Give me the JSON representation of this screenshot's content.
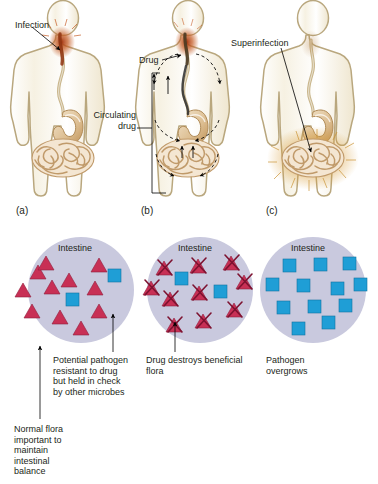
{
  "figure": {
    "type": "biological-diagram",
    "background_color": "#ffffff"
  },
  "top_row": {
    "panels": [
      {
        "letter": "(a)",
        "name": "panel-a-infection",
        "callouts": [
          {
            "name": "infection-label",
            "text": "Infection"
          }
        ]
      },
      {
        "letter": "(b)",
        "name": "panel-b-drug",
        "callouts": [
          {
            "name": "drug-label",
            "text": "Drug"
          },
          {
            "name": "circulating-drug-label",
            "text": "Circulating\ndrug"
          }
        ]
      },
      {
        "letter": "(c)",
        "name": "panel-c-superinfection",
        "callouts": [
          {
            "name": "superinfection-label",
            "text": "Superinfection"
          }
        ]
      }
    ]
  },
  "bottom_row": {
    "circle_title": "Intestine",
    "panels": [
      {
        "name": "intestine-circle-normal-flora",
        "title": "Intestine",
        "captions": [
          {
            "name": "caption-potential-pathogen",
            "text": "Potential pathogen\nresistant to drug\nbut held in check\nby other microbes"
          },
          {
            "name": "caption-normal-flora",
            "text": "Normal flora\nimportant to\nmaintain\nintestinal\nbalance"
          }
        ],
        "organisms": {
          "normal_flora_triangles": 11,
          "pathogen_squares": 2,
          "destroyed_flora": 0
        }
      },
      {
        "name": "intestine-circle-drug-destroys-flora",
        "title": "Intestine",
        "captions": [
          {
            "name": "caption-drug-destroys",
            "text": "Drug destroys beneficial\nflora"
          }
        ],
        "organisms": {
          "normal_flora_triangles": 0,
          "pathogen_squares": 4,
          "destroyed_flora": 10
        }
      },
      {
        "name": "intestine-circle-pathogen-overgrows",
        "title": "Intestine",
        "captions": [
          {
            "name": "caption-pathogen-overgrows",
            "text": "Pathogen\novergrows"
          }
        ],
        "organisms": {
          "normal_flora_triangles": 0,
          "pathogen_squares": 12,
          "destroyed_flora": 0
        }
      }
    ]
  },
  "legend_semantics": {
    "triangle_meaning": "normal beneficial flora",
    "crossed_triangle_meaning": "flora destroyed by drug",
    "square_meaning": "drug-resistant potential pathogen"
  },
  "colors": {
    "flora_triangle": "#c83055",
    "pathogen_square": "#1f9ed6",
    "circle_background": "#c9c9de",
    "body_outline": "#b9a77e",
    "infection_red": "#b5441f",
    "intestine_tan": "#d9b98c",
    "superinfection_glow": "#d79a33",
    "text": "#231f20"
  }
}
